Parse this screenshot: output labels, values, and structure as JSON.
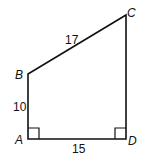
{
  "diagram": {
    "type": "quadrilateral",
    "vertices": {
      "A": {
        "label": "A",
        "x": 28,
        "y": 139
      },
      "B": {
        "label": "B",
        "x": 28,
        "y": 74
      },
      "C": {
        "label": "C",
        "x": 126,
        "y": 15
      },
      "D": {
        "label": "D",
        "x": 126,
        "y": 139
      }
    },
    "sides": {
      "BC": "17",
      "AB": "10",
      "AD": "15"
    },
    "right_angles": [
      "A",
      "D"
    ],
    "stroke_color": "#111111"
  }
}
